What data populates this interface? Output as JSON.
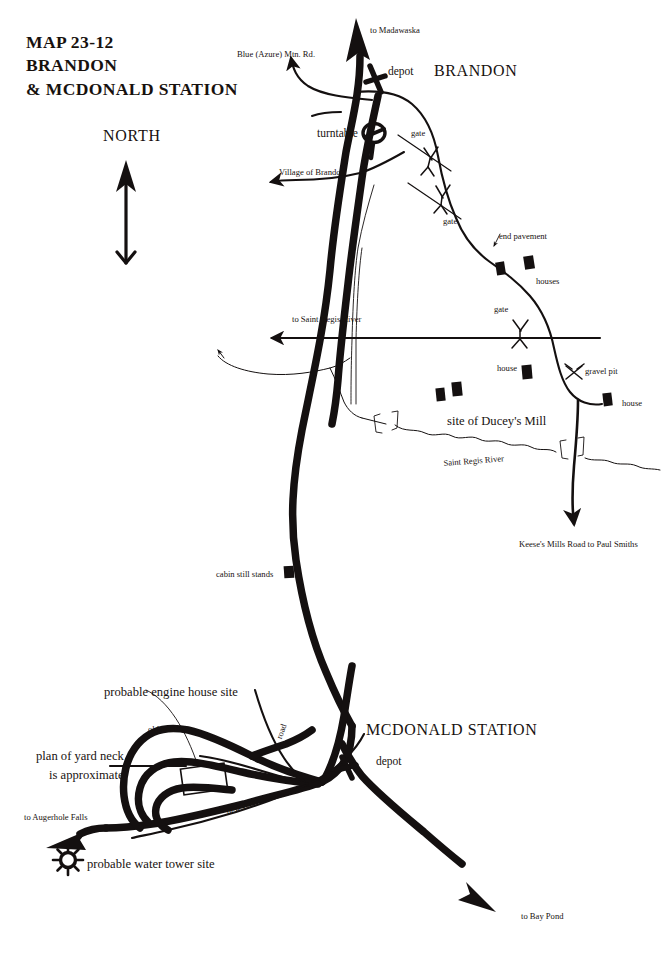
{
  "map": {
    "title_lines": [
      "MAP 23-12",
      "BRANDON",
      "& MCDONALD STATION"
    ],
    "compass": {
      "label": "NORTH",
      "icon": "north-arrow-icon"
    },
    "ink_color": "#141010",
    "paper_color": "#ffffff"
  },
  "places": {
    "brandon": "BRANDON",
    "mcdonald_station": "MCDONALD STATION"
  },
  "destinations": {
    "madawaska": "to Madawaska",
    "blue_azure_mtn_rd": "Blue (Azure) Mtn. Rd.",
    "village_of_brandon": "Village of Brandon",
    "saint_regis_river": "to Saint Regis River",
    "keeses_mills": "Keese's Mills Road to Paul Smiths",
    "augerhole_falls": "to Augerhole Falls",
    "bay_pond": "to Bay Pond"
  },
  "features": {
    "depot_brandon": "depot",
    "depot_mcdonald": "depot",
    "turntable": "turntable",
    "gate_1": "gate",
    "gate_2": "gate",
    "gate_3": "gate",
    "end_pavement": "end pavement",
    "houses": "houses",
    "house_1": "house",
    "house_2": "house",
    "gravel_pit": "gravel pit",
    "ducey_mill": "site of Ducey's Mill",
    "saint_regis_river_label": "Saint Regis River",
    "cabin": "cabin still stands",
    "engine_house": "probable engine house site",
    "water_tower": "probable water tower site",
    "old_road": "old road",
    "new_road": "new road",
    "road": "road",
    "yard_note_line1": "plan of yard neck",
    "yard_note_line2": "is approximate"
  },
  "icons": {
    "depot": "depot-cross-icon",
    "turntable": "turntable-circle-icon",
    "gate": "gate-marker-icon",
    "gravel_pit": "crossed-picks-icon",
    "water_tower": "water-tower-starburst-icon",
    "building": "building-block-icon",
    "bridge": "bridge-bracket-icon",
    "north_arrow": "north-arrow-icon"
  }
}
